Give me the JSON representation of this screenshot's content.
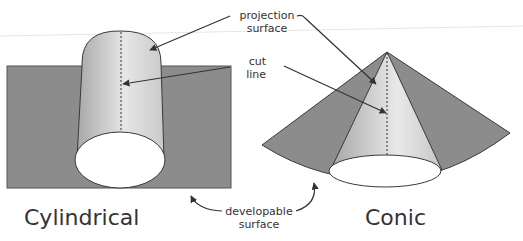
{
  "labels": {
    "projection_surface_line1": "projection",
    "projection_surface_line2": "surface",
    "cut_line_line1": "cut",
    "cut_line_line2": "line",
    "developable_surface_line1": "developable",
    "developable_surface_line2": "surface",
    "cylindrical": "Cylindrical",
    "conic": "Conic"
  },
  "colors": {
    "developable_surface": "#8c8c8c",
    "projection_surface_light": "#f2f2f2",
    "projection_surface_dark": "#a9a9a9",
    "outline": "#3a3a3a",
    "text": "#333333"
  }
}
